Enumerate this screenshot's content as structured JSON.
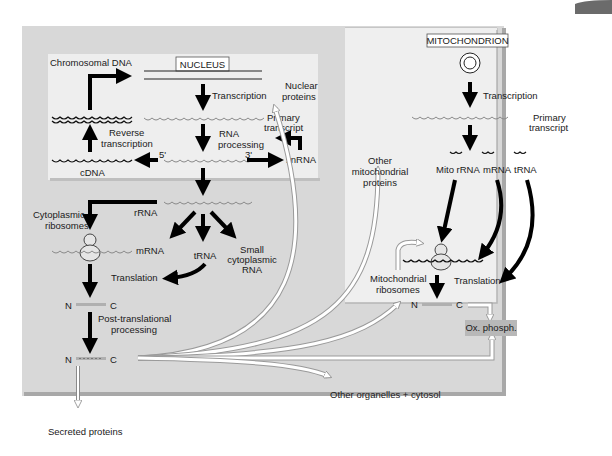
{
  "figure": {
    "type": "biological pathway diagram",
    "colors": {
      "outer_panel": "#d8d8d8",
      "inner_panel": "#ececec",
      "page_bg": "#ffffff",
      "arrow_black": "#000000",
      "arrow_white": "#ffffff",
      "ox_phosph_box": "#b8b8b8"
    }
  },
  "nucleus": {
    "title": "NUCLEUS",
    "chromosomal_dna": "Chromosomal DNA",
    "transcription": "Transcription",
    "nuclear_proteins_line1": "Nuclear",
    "nuclear_proteins_line2": "proteins",
    "primary_transcript_line1": "Primary",
    "primary_transcript_line2": "transcript",
    "rna_processing_line1": "RNA",
    "rna_processing_line2": "processing",
    "snrna": "snRNA",
    "reverse_transcription_line1": "Reverse",
    "reverse_transcription_line2": "transcription",
    "cdna": "cDNA",
    "five_prime": "5'",
    "three_prime": "3'"
  },
  "cytoplasm": {
    "rrna": "rRNA",
    "cytoplasmic_ribosomes_line1": "Cytoplasmic",
    "cytoplasmic_ribosomes_line2": "ribosomes",
    "mrna": "mRNA",
    "trna": "tRNA",
    "small_cytoplasmic_line1": "Small",
    "small_cytoplasmic_line2": "cytoplasmic",
    "small_cytoplasmic_line3": "RNA",
    "translation": "Translation",
    "n_terminus": "N",
    "c_terminus": "C",
    "post_translational_line1": "Post-translational",
    "post_translational_line2": "processing",
    "other_organelles": "Other organelles + cytosol",
    "secreted_proteins": "Secreted proteins"
  },
  "mitochondrion": {
    "title": "MITOCHONDRION",
    "transcription": "Transcription",
    "primary_transcript_line1": "Primary",
    "primary_transcript_line2": "transcript",
    "mito_rrna": "Mito rRNA",
    "mrna": "mRNA",
    "trna": "tRNA",
    "other_mito_proteins_line1": "Other",
    "other_mito_proteins_line2": "mitochondrial",
    "other_mito_proteins_line3": "proteins",
    "mito_ribosomes_line1": "Mitochondrial",
    "mito_ribosomes_line2": "ribosomes",
    "translation": "Translation",
    "n_terminus": "N",
    "c_terminus": "C",
    "ox_phosph": "Ox. phosph."
  }
}
